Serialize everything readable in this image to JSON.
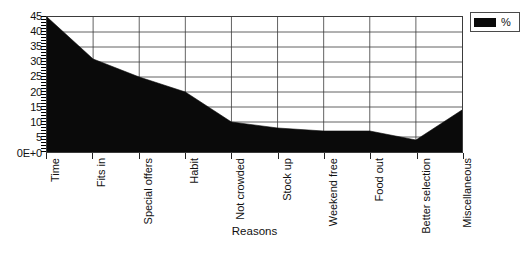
{
  "chart_data": {
    "type": "area",
    "title": "",
    "xlabel": "Reasons",
    "ylabel": "",
    "categories": [
      "Time",
      "Fits in",
      "Special offers",
      "Habit",
      "Not crowded",
      "Stock up",
      "Weekend free",
      "Food out",
      "Better selection",
      "Miscellaneous"
    ],
    "series": [
      {
        "name": "%",
        "values": [
          45,
          31,
          25,
          20,
          10,
          8,
          7,
          7,
          4,
          14
        ],
        "color": "#0a0a0a"
      }
    ],
    "ylim": [
      0,
      45
    ],
    "yticks": [
      0,
      5,
      10,
      15,
      20,
      25,
      30,
      35,
      40,
      45
    ],
    "ytick_labels": [
      "0E+0",
      "5",
      "10",
      "15",
      "20",
      "25",
      "30",
      "35",
      "40",
      "45"
    ],
    "grid": true,
    "legend_position": "top-right"
  },
  "legend": {
    "entries": [
      {
        "label": "%",
        "color": "#0a0a0a",
        "swatch_name": "percent-series-swatch"
      }
    ]
  },
  "axes": {
    "x_title": "Reasons"
  }
}
